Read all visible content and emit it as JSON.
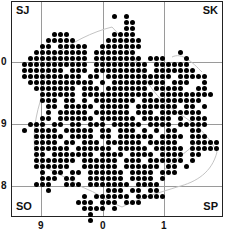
{
  "map": {
    "square_labels": {
      "top_left": "SJ",
      "top_right": "SK",
      "bottom_left": "SO",
      "bottom_right": "SP"
    },
    "y_ticks": [
      {
        "label": "0",
        "y": 62
      },
      {
        "label": "9",
        "y": 124
      },
      {
        "label": "8",
        "y": 186
      }
    ],
    "x_ticks": [
      {
        "label": "9",
        "x": 41
      },
      {
        "label": "0",
        "x": 103
      },
      {
        "label": "1",
        "x": 164
      }
    ],
    "grid": {
      "vertical_lines_x": [
        41,
        103,
        164
      ],
      "horizontal_lines_y": [
        62,
        124,
        186
      ]
    },
    "colors": {
      "dot": "#000000",
      "gridline": "#9a9a9a",
      "frame": "#222222",
      "boundary": "#bdbdbd"
    },
    "dot_grid": {
      "x0": 18,
      "y0": 16,
      "step": 6,
      "rows": [
        "................#.#...............",
        "..................##..............",
        "..................##..............",
        "......###.......####..............",
        ".....#####.....######.............",
        "....##.#####..#######.............",
        "...#########.#######.......#......",
        "..##########.########.###...#.....",
        ".###########.#########.######.....",
        ".#######.###.#########.#######....",
        ".##########.##.###########.#####..",
        "..###########.#.#########.###..#..",
        "...#######.###.#######.#####..##..",
        "....######.############.#########.",
        "....###.##.#.#######.##########...",
        ".....##.#####.#####.#######.##.#..",
        ".....#.#####.######.###.#######...",
        "....##.######.######.#####.#.###..",
        "..###.##.##.###.#####.####.#####..",
        ".#.####.#####.##.###.#.#.##..##...",
        "...#####.####.##.######.####.###..",
        "...####.##.###.######.#####..#####",
        "...######.######.#####.#####.#####",
        "...##.#######.####.####.####.##...",
        "...#######.######.###.######.#....",
        "...######..######.######.##.#.....",
        "....#.##.##.######.####.###.......",
        "....###.##..######.####.#.........",
        "...###..###.#######.####..........",
        ".....#.........###.##.##..........",
        "...........#.######.#####.........",
        "..........###.###.###.............",
        "...........####.#.................",
        "............#.....................",
        "............#....................."
      ]
    }
  }
}
